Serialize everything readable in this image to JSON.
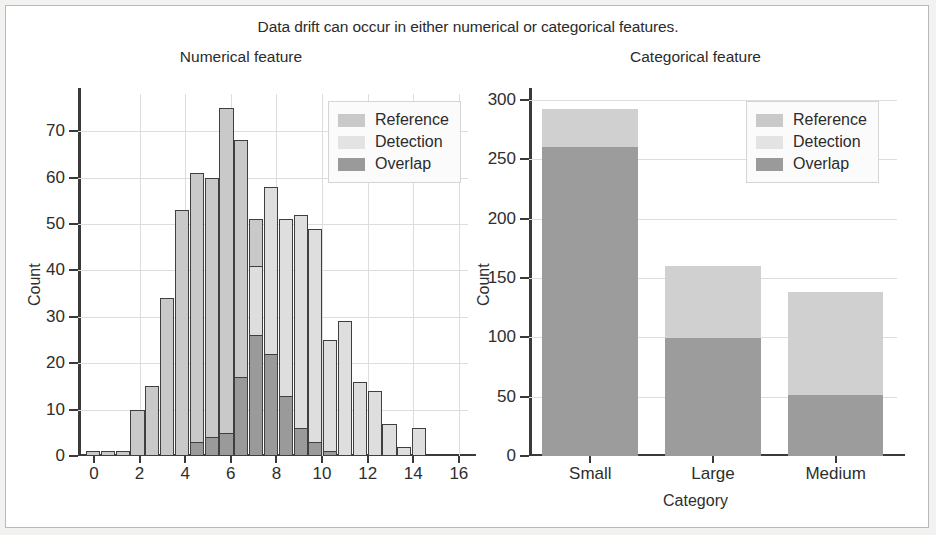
{
  "figure": {
    "suptitle": "Data drift can occur in either numerical or categorical features.",
    "background": "#ffffff",
    "border_color": "#b9b9b9"
  },
  "legend": {
    "reference_label": "Reference",
    "detection_label": "Detection",
    "overlap_label": "Overlap",
    "position": "upper right"
  },
  "colors": {
    "reference": "#c9c9c9",
    "detection": "#e3e3e3",
    "overlap": "#9a9a9a",
    "axis": "#3a3a3a",
    "grid": "#dddddd",
    "text": "#2b2b2b"
  },
  "chart_data": [
    {
      "type": "bar",
      "subtype": "histogram",
      "title": "Numerical feature",
      "xlabel": "",
      "ylabel": "Count",
      "xlim": [
        -0.7,
        16.4
      ],
      "ylim": [
        0,
        78
      ],
      "xticks": [
        0,
        2,
        4,
        6,
        8,
        10,
        12,
        14,
        16
      ],
      "yticks": [
        0,
        10,
        20,
        30,
        40,
        50,
        60,
        70
      ],
      "xtick_labels": [
        "0",
        "2",
        "4",
        "6",
        "8",
        "10",
        "12",
        "14",
        "16"
      ],
      "ytick_labels": [
        "0",
        "10",
        "20",
        "30",
        "40",
        "50",
        "60",
        "70"
      ],
      "grid": true,
      "legend": [
        "Reference",
        "Detection",
        "Overlap"
      ],
      "bin_width": 0.62,
      "bins_left": [
        -0.35,
        0.3,
        0.95,
        1.6,
        2.25,
        2.9,
        3.55,
        4.2,
        4.85,
        5.5,
        6.15,
        6.8,
        7.45,
        8.1,
        8.75,
        9.4,
        10.05,
        10.7,
        11.35,
        12.0,
        12.65,
        13.3,
        13.95,
        14.6
      ],
      "series": [
        {
          "name": "Reference",
          "values": [
            1,
            1,
            1,
            10,
            15,
            34,
            53,
            61,
            60,
            75,
            68,
            51,
            29,
            23,
            13,
            3,
            1,
            1,
            0,
            0,
            0,
            0,
            0,
            0
          ]
        },
        {
          "name": "Detection",
          "values": [
            0,
            0,
            0,
            0,
            0,
            0,
            0,
            3,
            4,
            5,
            17,
            41,
            58,
            51,
            52,
            49,
            25,
            29,
            16,
            14,
            7,
            2,
            6,
            0
          ]
        },
        {
          "name": "Overlap",
          "values": [
            0,
            0,
            0,
            0,
            0,
            0,
            0,
            3,
            4,
            5,
            17,
            26,
            22,
            13,
            6,
            3,
            1,
            0,
            0,
            0,
            0,
            0,
            0,
            0
          ]
        }
      ]
    },
    {
      "type": "bar",
      "subtype": "stacked-bar",
      "title": "Categorical feature",
      "xlabel": "Category",
      "ylabel": "Count",
      "categories": [
        "Small",
        "Large",
        "Medium"
      ],
      "ylim": [
        0,
        305
      ],
      "yticks": [
        0,
        50,
        100,
        150,
        200,
        250,
        300
      ],
      "ytick_labels": [
        "0",
        "50",
        "100",
        "150",
        "200",
        "250",
        "300"
      ],
      "grid": true,
      "legend": [
        "Reference",
        "Detection",
        "Overlap"
      ],
      "series": [
        {
          "name": "Total",
          "values": [
            292,
            160,
            138
          ]
        },
        {
          "name": "Overlap",
          "values": [
            260,
            99,
            51
          ]
        },
        {
          "name": "Detection",
          "values": [
            32,
            61,
            87
          ]
        }
      ]
    }
  ]
}
